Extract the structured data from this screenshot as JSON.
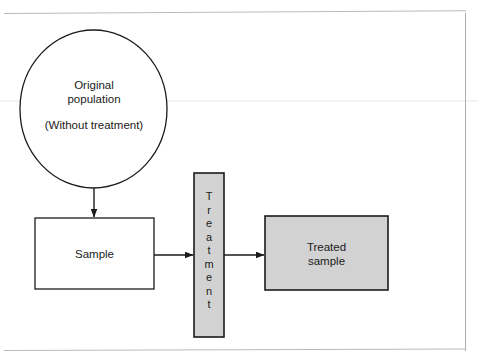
{
  "figure": {
    "kind": "flow-diagram",
    "caption_present": false,
    "background_color": "#ffffff",
    "frame_color": "#b9b9b9",
    "stroke_color": "#1b1b1b",
    "fill_white": "#ffffff",
    "fill_gray": "#d2d2d2"
  },
  "nodes": {
    "population": {
      "shape": "circle",
      "label_line1": "Original",
      "label_line2": "population",
      "label_sub": "(Without treatment)",
      "fill": "#ffffff"
    },
    "sample": {
      "shape": "rectangle",
      "label": "Sample",
      "fill": "#ffffff"
    },
    "treatment": {
      "shape": "vertical-bar",
      "label": "Treatment",
      "letters": [
        "T",
        "r",
        "e",
        "a",
        "t",
        "m",
        "e",
        "n",
        "t"
      ],
      "fill": "#d2d2d2"
    },
    "treated_sample": {
      "shape": "rectangle",
      "label_line1": "Treated",
      "label_line2": "sample",
      "fill": "#d2d2d2"
    }
  },
  "edges": [
    {
      "id": "population-to-sample",
      "from": "population",
      "to": "sample",
      "direction": "down",
      "arrowhead": true
    },
    {
      "id": "sample-to-treatment",
      "from": "sample",
      "to": "treatment",
      "direction": "right",
      "arrowhead": true
    },
    {
      "id": "treatment-to-treated-sample",
      "from": "treatment",
      "to": "treated_sample",
      "direction": "right",
      "arrowhead": true
    }
  ]
}
